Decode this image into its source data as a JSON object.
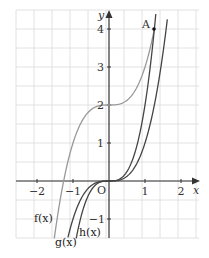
{
  "chart_data": {
    "type": "line",
    "title": "",
    "xlabel": "x",
    "ylabel": "y",
    "xlim": [
      -2.58,
      2.5
    ],
    "ylim": [
      -1.5,
      4.5
    ],
    "grid": true,
    "grid_step": 0.5,
    "x_ticks": [
      -2,
      -1,
      1,
      2
    ],
    "x_tick_labels": [
      "−2",
      "−1",
      "1",
      "2"
    ],
    "y_ticks": [
      -1,
      1,
      2,
      3,
      4
    ],
    "y_tick_labels": [
      "−1",
      "1",
      "2",
      "3",
      "4"
    ],
    "origin_label": "O",
    "series": [
      {
        "name": "f(x)",
        "label": "f(x)",
        "color": "#999999",
        "expr": "x^3 + 2",
        "x_range": [
          -1.52,
          1.26
        ]
      },
      {
        "name": "g(x)",
        "label": "g(x)",
        "color": "#444444",
        "expr": "x^3 (bottom end) / steep branch",
        "x_range": [
          -1.14,
          1.3
        ]
      },
      {
        "name": "h(x)",
        "label": "h(x)",
        "color": "#444444",
        "expr": "x^3",
        "x_range": [
          -0.92,
          1.62
        ]
      }
    ],
    "annotations": [
      {
        "label": "A",
        "x": 1.26,
        "y": 4,
        "marker": "point"
      }
    ]
  },
  "labels": {
    "x_axis": "x",
    "y_axis": "y",
    "origin": "O",
    "point_a": "A",
    "f": "f(x)",
    "g": "g(x)",
    "h": "h(x)",
    "tick_x_m2": "−2",
    "tick_x_m1": "−1",
    "tick_x_1": "1",
    "tick_x_2": "2",
    "tick_y_m1": "−1",
    "tick_y_1": "1",
    "tick_y_2": "2",
    "tick_y_3": "3",
    "tick_y_4": "4"
  },
  "colors": {
    "grid": "#d8d8d8",
    "axis": "#333333",
    "f_curve": "#999999",
    "gh_curve": "#444444"
  }
}
